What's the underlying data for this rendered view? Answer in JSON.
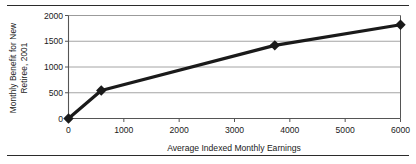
{
  "figure": {
    "top_rule": "horizontal-rule",
    "bottom_rule": "horizontal-rule"
  },
  "chart_data": {
    "type": "line",
    "title": "",
    "xlabel": "Average Indexed Monthly Earnings",
    "ylabel_lines": [
      "Monthly Benefit for New",
      "Retiree, 2001"
    ],
    "ylabel": "Monthly Benefit for New Retiree, 2001",
    "x": [
      0,
      592,
      3728,
      6000
    ],
    "values": [
      0,
      545,
      1420,
      1820
    ],
    "points": [
      {
        "x": 0,
        "y": 0
      },
      {
        "x": 592,
        "y": 545
      },
      {
        "x": 3728,
        "y": 1420
      },
      {
        "x": 6000,
        "y": 1820
      }
    ],
    "xlim": [
      0,
      6000
    ],
    "ylim": [
      0,
      2000
    ],
    "xticks": [
      0,
      1000,
      2000,
      3000,
      4000,
      5000,
      6000
    ],
    "xtick_labels": [
      "0",
      "1000",
      "2000",
      "3000",
      "4000",
      "5000",
      "6000"
    ],
    "yticks": [
      0,
      500,
      1000,
      1500,
      2000
    ],
    "ytick_labels": [
      "0",
      "500",
      "1000",
      "1500",
      "2000"
    ],
    "grid": "horizontal",
    "legend": "none",
    "marker": "diamond",
    "series_color": "#1a1a1a",
    "grid_color": "#9a9a9a",
    "axis_color": "#555555",
    "line_width": 3.2,
    "marker_size": 5.2
  }
}
